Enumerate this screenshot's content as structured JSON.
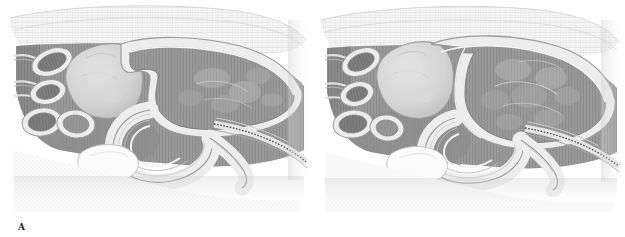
{
  "figure": {
    "background_color": "#ffffff",
    "width": 625,
    "height": 237,
    "layout": "two panels side by side",
    "style": "grayscale stippled and hatched medical line illustration"
  },
  "panels": [
    {
      "id": "A",
      "label": "A",
      "caption_position": "below-left",
      "description": "Sagittal section showing the large hollow viscus in a collapsed, flattened state with an anterior notch; adjacent rounded organ at left and a coiled tubular loop below.",
      "state": "empty / non-distended",
      "palette": {
        "outline": "#6e6e6e",
        "wall_light": "#e8e8e8",
        "lumen_mid": "#9b9b9b",
        "lumen_dark": "#7d7d7d",
        "organ_pale": "#d4d4d4",
        "stipple_band": "#efefef",
        "shadow": "#bdbdbd"
      }
    },
    {
      "id": "B",
      "label": "B",
      "caption_position": "below-left",
      "description": "Sagittal section showing the same large hollow viscus in a rounded, fully distended state filling the space; adjacent rounded organ at left and a coiled tubular loop below.",
      "state": "filled / distended",
      "palette": {
        "outline": "#6e6e6e",
        "wall_light": "#e8e8e8",
        "lumen_mid": "#9b9b9b",
        "lumen_dark": "#7d7d7d",
        "organ_pale": "#d4d4d4",
        "stipple_band": "#efefef",
        "shadow": "#bdbdbd"
      }
    }
  ],
  "structures": {
    "stipple_band_top": "superficial connective tissue / fascia band with fine cross-hatching",
    "tubular_cross_sections": "cluster of four to five oval tubular cross-sections with thick pale walls at the left margin",
    "pale_round_organ": "large pale rounded organ with mottled surface, left of center",
    "large_hollow_viscus": "large hollow viscus occupying the right two thirds, thick pale wall with mid-gray mottled lumen",
    "coiled_tubular_loop": "long coiled tubular loop with concentric pale banding, lower center",
    "serrated_band": "narrow serrated dark band running to the lower right margin",
    "lower_round_structure": "small rounded structure at the lower left of center"
  }
}
